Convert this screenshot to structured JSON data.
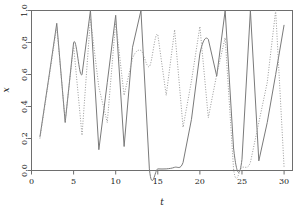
{
  "chart_data": {
    "type": "line",
    "title": "",
    "subtitle": "",
    "xlabel": "t",
    "ylabel": "x",
    "xlim": [
      0,
      31
    ],
    "ylim": [
      0.0,
      1.0
    ],
    "xticks": [
      0,
      5,
      10,
      15,
      20,
      25,
      30
    ],
    "xticklabels": [
      "0",
      "5",
      "10",
      "15",
      "20",
      "25",
      "30"
    ],
    "yticks": [
      0.0,
      0.2,
      0.4,
      0.6,
      0.8,
      1.0
    ],
    "yticklabels": [
      "0.0",
      "0.2",
      "0.4",
      "0.6",
      "0.8",
      "1.0"
    ],
    "grid": false,
    "legend": "none",
    "x": [
      1,
      2,
      3,
      4,
      5,
      6,
      7,
      8,
      9,
      10,
      11,
      12,
      13,
      14,
      15,
      16,
      17,
      18,
      19,
      20,
      21,
      22,
      23,
      24,
      25,
      26,
      27,
      28,
      29,
      30
    ],
    "series": [
      {
        "name": "solid-trajectory",
        "style": "solid",
        "color": "#7a7a7a",
        "linewidth": 1.0,
        "values": [
          0.21,
          0.56,
          0.92,
          0.3,
          0.8,
          0.6,
          1.0,
          0.13,
          0.55,
          0.97,
          0.15,
          0.77,
          1.0,
          0.01,
          0.01,
          0.01,
          0.02,
          0.05,
          0.32,
          0.73,
          0.82,
          0.59,
          1.0,
          0.14,
          0.07,
          1.0,
          0.06,
          0.3,
          0.6,
          0.91
        ]
      },
      {
        "name": "dotted-trajectory",
        "style": "dotted",
        "color": "#9a9a9a",
        "linewidth": 1.0,
        "values": [
          0.2,
          0.55,
          0.9,
          0.31,
          0.78,
          0.22,
          0.95,
          0.52,
          0.3,
          0.93,
          0.47,
          0.7,
          0.75,
          0.65,
          0.85,
          0.47,
          0.88,
          0.27,
          0.56,
          0.9,
          0.33,
          0.6,
          0.83,
          0.01,
          0.02,
          0.05,
          0.3,
          0.55,
          1.0,
          0.02
        ]
      }
    ]
  },
  "axes": {
    "x_title": "t",
    "y_title": "x"
  },
  "colors": {
    "frame": "#6e6e6e",
    "solid_series": "#7a7a7a",
    "dotted_series": "#9a9a9a",
    "text": "#1a1a1a",
    "background": "#ffffff"
  }
}
